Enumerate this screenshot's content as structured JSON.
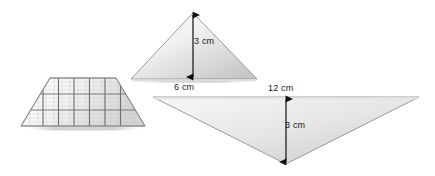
{
  "figure": {
    "background_color": "#ffffff"
  },
  "shapes": {
    "trapezoid": {
      "name": "gridded-trapezoid",
      "grid_rows": 3,
      "grid_columns": 6,
      "fill_light": "#fdfdfd",
      "fill_dark": "#d2d2d2",
      "stroke": "#8a8a8a",
      "grid_stroke": "#7d7d7d",
      "top_left_x": 50,
      "top_right_x": 116,
      "bottom_left_x": 21,
      "bottom_right_x": 145,
      "top_y": 78,
      "bottom_y": 126
    },
    "triangle_small": {
      "name": "upright-triangle",
      "apex_x": 193,
      "apex_y": 13,
      "base_left_x": 131,
      "base_right_x": 257,
      "base_y": 79,
      "fill_light": "#fcfcfc",
      "fill_dark": "#c9c9c9",
      "stroke": "#8f8f8f"
    },
    "triangle_large": {
      "name": "inverted-triangle",
      "top_left_x": 153,
      "top_right_x": 419,
      "top_y": 97,
      "apex_x": 286,
      "apex_y": 164,
      "fill_light": "#f2f2f2",
      "fill_dark": "#cfcfcf",
      "stroke": "#909090"
    }
  },
  "dimensions": {
    "small_triangle_height": {
      "label": "3 cm",
      "value": 3,
      "unit": "cm",
      "orientation": "vertical",
      "arrow_x": 193,
      "arrow_top_y": 14,
      "arrow_bottom_y": 78
    },
    "small_triangle_base": {
      "label": "6 cm",
      "value": 6,
      "unit": "cm",
      "orientation": "horizontal-caption"
    },
    "large_triangle_base": {
      "label": "12 cm",
      "value": 12,
      "unit": "cm",
      "orientation": "horizontal-caption"
    },
    "large_triangle_height": {
      "label": "3 cm",
      "value": 3,
      "unit": "cm",
      "orientation": "vertical",
      "arrow_x": 286,
      "arrow_top_y": 98,
      "arrow_bottom_y": 163
    }
  },
  "colors": {
    "text": "#1a1a1a",
    "arrow": "#111111",
    "shadow": "#c8c8c8"
  }
}
